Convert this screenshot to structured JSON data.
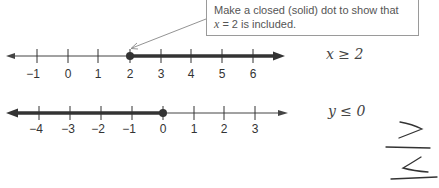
{
  "callout": {
    "line1": "Make a closed (solid) dot to show that",
    "line2_var": "x",
    "line2_rest": " = 2 is included."
  },
  "number_line_1": {
    "ticks": [
      "−1",
      "0",
      "1",
      "2",
      "3",
      "4",
      "5",
      "6"
    ],
    "solution_start": 2,
    "endpoint": "closed",
    "direction": "right",
    "inequality": "x ≥ 2"
  },
  "number_line_2": {
    "ticks": [
      "−4",
      "−3",
      "−2",
      "−1",
      "0",
      "1",
      "2",
      "3"
    ],
    "solution_end": 0,
    "endpoint": "closed",
    "direction": "left",
    "inequality": "y ≤ 0"
  },
  "handwritten_symbols": [
    "≥",
    "≤"
  ],
  "cut_off_text": "Keep ... Practice"
}
